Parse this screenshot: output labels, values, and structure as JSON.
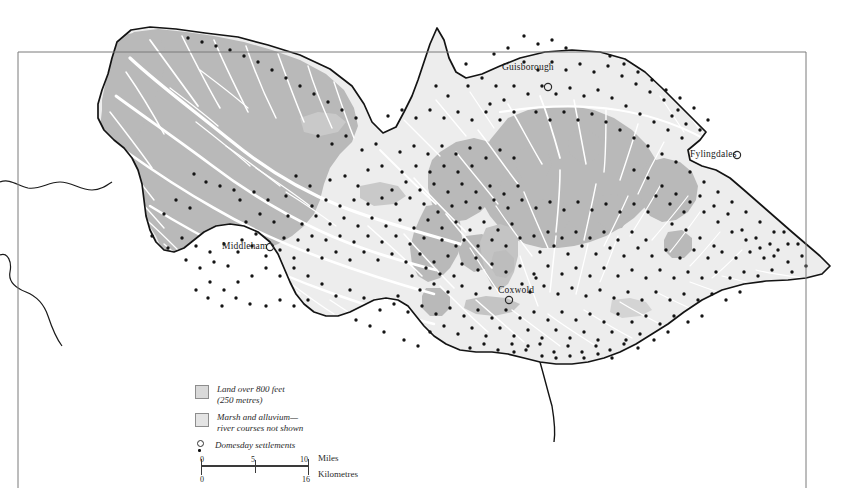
{
  "map": {
    "title": "Domesday settlements of the North Riding of Yorkshire",
    "places": [
      {
        "name": "Guisborough",
        "label_x": 502,
        "label_y": 68,
        "marker_x": 548,
        "marker_y": 87,
        "marker": "open-circle"
      },
      {
        "name": "Fylingdales",
        "label_x": 690,
        "label_y": 149,
        "marker_x": 737,
        "marker_y": 155,
        "marker": "open-circle"
      },
      {
        "name": "Middleham",
        "label_x": 222,
        "label_y": 243,
        "marker_x": 270,
        "marker_y": 247,
        "marker": "open-circle"
      },
      {
        "name": "Coxwold",
        "label_x": 498,
        "label_y": 287,
        "marker_x": 509,
        "marker_y": 300,
        "marker": "open-circle"
      }
    ],
    "colors": {
      "upland": "#b9b9b9",
      "lowland": "#ededed",
      "marsh": "#c9c9c9",
      "river": "#ffffff",
      "coastline": "#1a1a1a",
      "frame": "#6f6f6f",
      "settlement_dot": "#141414",
      "background": "#ffffff"
    }
  },
  "legend": {
    "items": [
      {
        "kind": "swatch-upland",
        "line1": "Land over 800 feet",
        "line2": "(250 metres)"
      },
      {
        "kind": "swatch-marsh",
        "line1": "Marsh and alluvium—",
        "line2": "river courses not shown"
      },
      {
        "kind": "marker",
        "line1": "Domesday settlements",
        "line2": ""
      }
    ]
  },
  "scale": {
    "miles": {
      "start": "0",
      "mid": "5",
      "end": "10",
      "unit": "Miles"
    },
    "kilometres": {
      "start": "0",
      "mid": "8",
      "end": "16",
      "unit": "Kilometres"
    }
  }
}
